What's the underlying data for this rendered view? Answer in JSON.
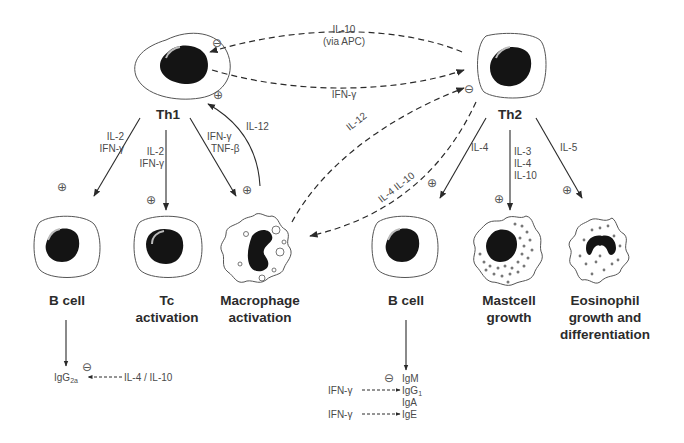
{
  "cells": {
    "th1": {
      "label": "Th1"
    },
    "th2": {
      "label": "Th2"
    },
    "b_cell_left": {
      "label": "B cell"
    },
    "tc": {
      "label_line1": "Tc",
      "label_line2": "activation"
    },
    "macrophage": {
      "label_line1": "Macrophage",
      "label_line2": "activation"
    },
    "b_cell_right": {
      "label": "B cell"
    },
    "mastcell": {
      "label_line1": "Mastcell",
      "label_line2": "growth"
    },
    "eosinophil": {
      "label_line1": "Eosinophil",
      "label_line2": "growth and",
      "label_line3": "differentiation"
    }
  },
  "edges": {
    "th2_to_th1": {
      "line1": "IL-10",
      "line2": "(via APC)",
      "sign": "⊖"
    },
    "th1_to_th2": {
      "label": "IFN-γ"
    },
    "th1_to_bcell": {
      "line1": "IL-2",
      "line2": "IFN-γ",
      "sign": "⊕"
    },
    "th1_to_tc": {
      "line1": "IL-2",
      "line2": "IFN-γ",
      "sign": "⊕"
    },
    "th1_to_macrophage": {
      "line1": "IFN-γ",
      "line2": "TNF-β",
      "sign": "⊕"
    },
    "macrophage_to_th1": {
      "label": "IL-12",
      "sign": "⊕"
    },
    "macrophage_to_th2": {
      "label": "IL-12",
      "sign": "⊖"
    },
    "th2_to_macrophage": {
      "label": "IL-4 IL-10"
    },
    "th2_to_bcell": {
      "label": "IL-4",
      "sign": "⊕"
    },
    "th2_to_mastcell": {
      "line1": "IL-3",
      "line2": "IL-4",
      "line3": "IL-10",
      "sign": "⊕"
    },
    "th2_to_eosinophil": {
      "label": "IL-5",
      "sign": "⊕"
    }
  },
  "left_output": {
    "ig_base": "IgG",
    "ig_sub": "2a",
    "inhibitor": "IL-4 / IL-10",
    "sign": "⊖"
  },
  "right_output": {
    "sign": "⊖",
    "igm": "IgM",
    "igg1_base": "IgG",
    "igg1_sub": "1",
    "iga": "IgA",
    "ige": "IgE",
    "ifn_1": "IFN-γ",
    "ifn_2": "IFN-γ"
  },
  "colors": {
    "line": "#3a3a3a",
    "nucleus": "#141414",
    "membrane": "#555555",
    "text": "#4a4a4a"
  }
}
